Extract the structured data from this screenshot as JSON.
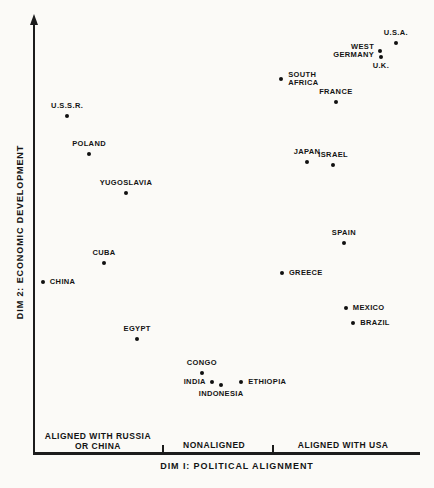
{
  "figure": {
    "background": "#fbfaf7",
    "ink": "#1c1c1c"
  },
  "chart_data": {
    "type": "scatter",
    "title": "",
    "xlabel": "DIM I: POLITICAL ALIGNMENT",
    "ylabel": "DIM 2: ECONOMIC DEVELOPMENT",
    "axis_style": {
      "y_has_arrow": true,
      "x_has_arrow": false,
      "numeric_ticks": false,
      "grid": false
    },
    "x_range_note": "ordinal zones only",
    "zone_divider_fracs": [
      0.335,
      0.621
    ],
    "x_zones": [
      {
        "lines": [
          "ALIGNED WITH RUSSIA",
          "OR CHINA"
        ],
        "center_frac": 0.166
      },
      {
        "lines": [
          "NONALIGNED"
        ],
        "center_frac": 0.468
      },
      {
        "lines": [
          "ALIGNED WITH USA"
        ],
        "center_frac": 0.803
      }
    ],
    "points": [
      {
        "name": "U.S.A.",
        "lines": [
          "U.S.A."
        ],
        "dim1": 0.94,
        "dim2": 0.947,
        "label_pos": "above"
      },
      {
        "name": "WEST GERMANY",
        "lines": [
          "WEST",
          "GERMANY"
        ],
        "dim1": 0.899,
        "dim2": 0.929,
        "label_pos": "left"
      },
      {
        "name": "U.K.",
        "lines": [
          "U.K."
        ],
        "dim1": 0.901,
        "dim2": 0.915,
        "label_pos": "below"
      },
      {
        "name": "SOUTH AFRICA",
        "lines": [
          "SOUTH",
          "AFRICA"
        ],
        "dim1": 0.642,
        "dim2": 0.864,
        "label_pos": "right"
      },
      {
        "name": "FRANCE",
        "lines": [
          "FRANCE"
        ],
        "dim1": 0.784,
        "dim2": 0.811,
        "label_pos": "above"
      },
      {
        "name": "U.S.S.R.",
        "lines": [
          "U.S.S.R."
        ],
        "dim1": 0.086,
        "dim2": 0.779,
        "label_pos": "above"
      },
      {
        "name": "POLAND",
        "lines": [
          "POLAND"
        ],
        "dim1": 0.143,
        "dim2": 0.691,
        "label_pos": "above"
      },
      {
        "name": "JAPAN",
        "lines": [
          "JAPAN"
        ],
        "dim1": 0.709,
        "dim2": 0.673,
        "label_pos": "above"
      },
      {
        "name": "ISRAEL",
        "lines": [
          "ISRAEL"
        ],
        "dim1": 0.777,
        "dim2": 0.666,
        "label_pos": "above"
      },
      {
        "name": "YUGOSLAVIA",
        "lines": [
          "YUGOSLAVIA"
        ],
        "dim1": 0.239,
        "dim2": 0.601,
        "label_pos": "above"
      },
      {
        "name": "SPAIN",
        "lines": [
          "SPAIN"
        ],
        "dim1": 0.805,
        "dim2": 0.486,
        "label_pos": "above"
      },
      {
        "name": "CUBA",
        "lines": [
          "CUBA"
        ],
        "dim1": 0.182,
        "dim2": 0.44,
        "label_pos": "above"
      },
      {
        "name": "GREECE",
        "lines": [
          "GREECE"
        ],
        "dim1": 0.644,
        "dim2": 0.417,
        "label_pos": "right"
      },
      {
        "name": "CHINA",
        "lines": [
          "CHINA"
        ],
        "dim1": 0.023,
        "dim2": 0.396,
        "label_pos": "right"
      },
      {
        "name": "MEXICO",
        "lines": [
          "MEXICO"
        ],
        "dim1": 0.81,
        "dim2": 0.336,
        "label_pos": "right"
      },
      {
        "name": "BRAZIL",
        "lines": [
          "BRAZIL"
        ],
        "dim1": 0.829,
        "dim2": 0.302,
        "label_pos": "right"
      },
      {
        "name": "EGYPT",
        "lines": [
          "EGYPT"
        ],
        "dim1": 0.268,
        "dim2": 0.265,
        "label_pos": "above"
      },
      {
        "name": "CONGO",
        "lines": [
          "CONGO"
        ],
        "dim1": 0.436,
        "dim2": 0.187,
        "label_pos": "above"
      },
      {
        "name": "INDIA",
        "lines": [
          "INDIA"
        ],
        "dim1": 0.462,
        "dim2": 0.166,
        "label_pos": "left"
      },
      {
        "name": "ETHIOPIA",
        "lines": [
          "ETHIOPIA"
        ],
        "dim1": 0.538,
        "dim2": 0.166,
        "label_pos": "right"
      },
      {
        "name": "INDONESIA",
        "lines": [
          "INDONESIA"
        ],
        "dim1": 0.486,
        "dim2": 0.159,
        "label_pos": "below"
      }
    ]
  }
}
